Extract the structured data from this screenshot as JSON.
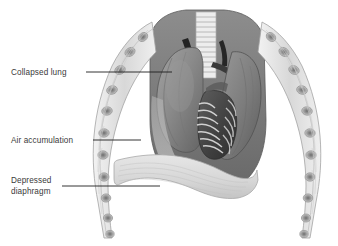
{
  "figure": {
    "background_color": "#ffffff",
    "palette": {
      "line_dark": "#1d1d1d",
      "text": "#3a3a3a",
      "lung_mid_gray": "#8a8a8a",
      "lung_dark_gray": "#6f6f6f",
      "lung_shadow": "#5a5a5a",
      "vessel_black": "#222222",
      "rib_light": "#e9e9e9",
      "rib_outline": "#9a9a9a",
      "rib_core": "#7d7d7d",
      "diaphragm_light": "#dcdcdc",
      "diaphragm_outline": "#a8a8a8",
      "trachea_light": "#ededed",
      "air_space": "#c8c8c8",
      "heart_dark": "#4a4a4a"
    }
  },
  "labels": [
    {
      "id": "collapsed-lung",
      "text": "Collapsed lung",
      "lines": [
        "Collapsed lung"
      ],
      "text_x": 11,
      "text_y": 75,
      "leader": {
        "x1": 86,
        "y1": 72,
        "x2": 172,
        "y2": 72
      }
    },
    {
      "id": "air-accumulation",
      "text": "Air accumulation",
      "lines": [
        "Air accumulation"
      ],
      "text_x": 11,
      "text_y": 143,
      "leader": {
        "x1": 93,
        "y1": 140,
        "x2": 141,
        "y2": 140
      }
    },
    {
      "id": "depressed-diaphragm",
      "text": "Depressed diaphragm",
      "lines": [
        "Depressed",
        "diaphragm"
      ],
      "text_x": 11,
      "text_y": 183,
      "text_y2": 194,
      "leader": {
        "x1": 62,
        "y1": 186,
        "x2": 160,
        "y2": 186
      }
    }
  ],
  "anatomy": {
    "parts": [
      {
        "name": "trachea",
        "description": "Cartilage-ringed airway descending from thorax apex, center top"
      },
      {
        "name": "left-rib-cage",
        "description": "Chain of oval rib cross-sections along left chest wall"
      },
      {
        "name": "right-rib-cage",
        "description": "Chain of oval rib cross-sections along right chest wall"
      },
      {
        "name": "collapsed-lung",
        "description": "Mid-gray shrunken lung mass on viewer left"
      },
      {
        "name": "right-lung",
        "description": "Large gray lung mass on viewer right"
      },
      {
        "name": "heart",
        "description": "Dark mediastinal heart with vessel bands, center"
      },
      {
        "name": "great-vessels",
        "description": "Near-black vascular structures flanking trachea"
      },
      {
        "name": "depressed-diaphragm",
        "description": "Flattened light dome at thorax base"
      },
      {
        "name": "air-accumulation-space",
        "description": "Light pleural air space between lung and chest wall"
      }
    ]
  }
}
